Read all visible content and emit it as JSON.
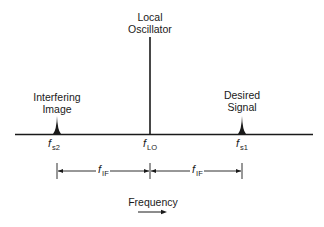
{
  "diagram": {
    "signals": [
      {
        "id": "image",
        "label_line1": "Interfering",
        "label_line2": "Image",
        "freq_symbol": "f",
        "freq_sub": "s2"
      },
      {
        "id": "lo",
        "label_line1": "Local",
        "label_line2": "Oscillator",
        "freq_symbol": "f",
        "freq_sub": "LO"
      },
      {
        "id": "desired",
        "label_line1": "Desired",
        "label_line2": "Signal",
        "freq_symbol": "f",
        "freq_sub": "s1"
      }
    ],
    "spacing": [
      {
        "symbol": "f",
        "sub": "IF"
      },
      {
        "symbol": "f",
        "sub": "IF"
      }
    ],
    "axis_label": "Frequency",
    "colors": {
      "ink": "#1a1a1a",
      "background": "#ffffff"
    }
  }
}
